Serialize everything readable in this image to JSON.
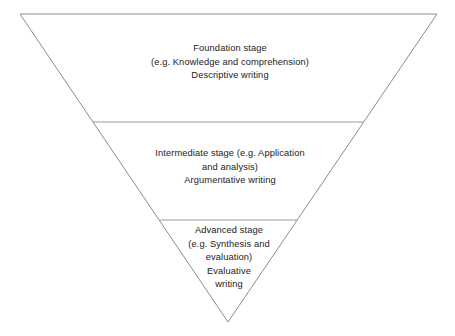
{
  "diagram": {
    "type": "inverted-pyramid",
    "title": "",
    "style": {
      "background_color": "#ffffff",
      "outline_color": "#8c8c8c",
      "divider_color": "#9a9a9a",
      "text_color": "#222222"
    },
    "geometry": {
      "top_left": [
        20,
        14
      ],
      "top_right": [
        437,
        14
      ],
      "apex": [
        228,
        322
      ],
      "dividers": [
        {
          "y": 122,
          "x_start": 93,
          "x_end": 363
        },
        {
          "y": 220,
          "x_start": 160,
          "x_end": 297
        }
      ]
    },
    "tiers": [
      {
        "id": "foundation",
        "name": "Foundation stage",
        "order": 1,
        "text": "Foundation stage\n(e.g. Knowledge and comprehension)\nDescriptive writing",
        "lines": [
          "Foundation stage",
          "(e.g. Knowledge and comprehension)",
          "Descriptive writing"
        ],
        "stage": "Foundation stage",
        "examples": "e.g. Knowledge and comprehension",
        "writing_type": "Descriptive writing"
      },
      {
        "id": "intermediate",
        "name": "Intermediate stage",
        "order": 2,
        "text": "Intermediate stage (e.g. Application\nand analysis)\nArgumentative writing",
        "lines": [
          "Intermediate stage (e.g. Application",
          "and analysis)",
          "Argumentative writing"
        ],
        "stage": "Intermediate stage",
        "examples": "e.g. Application and analysis",
        "writing_type": "Argumentative writing"
      },
      {
        "id": "advanced",
        "name": "Advanced stage",
        "order": 3,
        "text": "Advanced stage\n(e.g. Synthesis and\nevaluation)\nEvaluative\nwriting",
        "lines": [
          "Advanced stage",
          "(e.g. Synthesis and",
          "evaluation)",
          "Evaluative",
          "writing"
        ],
        "stage": "Advanced stage",
        "examples": "e.g. Synthesis and evaluation",
        "writing_type": "Evaluative writing"
      }
    ]
  }
}
